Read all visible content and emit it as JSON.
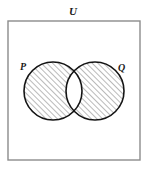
{
  "figure": {
    "width": 147,
    "height": 170,
    "background_color": "#ffffff",
    "kind": "venn-diagram"
  },
  "universe": {
    "label": "U",
    "label_x": 73,
    "label_y": 15,
    "rect": {
      "x": 8,
      "y": 21,
      "width": 132,
      "height": 139
    },
    "border_color": "#8c8c8c",
    "border_width": 1.4,
    "fill_color": "#ffffff"
  },
  "sets": [
    {
      "id": "set-p",
      "label": "P",
      "label_x": 20,
      "label_y": 70,
      "cx": 53,
      "cy": 91,
      "r": 29,
      "stroke_color": "#141414",
      "stroke_width": 1.6,
      "shaded": true
    },
    {
      "id": "set-q",
      "label": "Q",
      "label_x": 118,
      "label_y": 71,
      "cx": 95,
      "cy": 91,
      "r": 29,
      "stroke_color": "#141414",
      "stroke_width": 1.6,
      "shaded": true
    }
  ],
  "shading": {
    "region": "symmetric-difference",
    "region_expression": "P △ Q",
    "pattern": "diagonal-hatch",
    "hatch_angle_degrees": 45,
    "hatch_direction": "up-right",
    "hatch_spacing_px": 4,
    "hatch_line_color": "#a8a8a8",
    "hatch_line_width": 1.6,
    "hatch_background": "#ffffff",
    "intersection_shaded": false,
    "intersection_fill": "#ffffff",
    "outside_circles_shaded": false
  }
}
